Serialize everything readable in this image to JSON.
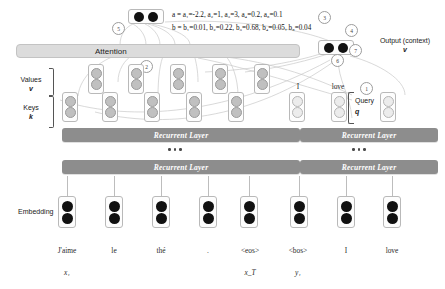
{
  "diagram": {
    "labels": {
      "attention": "Attention",
      "recurrent_layer": "Recurrent Layer",
      "embedding": "Embedding",
      "values": "Values",
      "values_symbol": "v",
      "keys": "Keys",
      "keys_symbol": "k",
      "query": "Query",
      "query_symbol": "q",
      "output": "Output (context)",
      "output_symbol": "v"
    },
    "formulas": {
      "a": "a = a₁=-2.2, a₂=1, a₃=3, a₄=0.2, a₅=0.1",
      "b": "b = b₁=0.01, b₂=0.22, b₃=0.68, b₄=0.05, b₅=0.04"
    },
    "attention_scores": {
      "a_name": "a",
      "a_values": [
        -2.2,
        1,
        3,
        0.2,
        0.1
      ],
      "b_name": "b",
      "b_values": [
        0.01,
        0.22,
        0.68,
        0.05,
        0.04
      ]
    },
    "steps": [
      {
        "id": "1",
        "meaning": "query"
      },
      {
        "id": "2",
        "meaning": "attention"
      },
      {
        "id": "3",
        "meaning": "scores-a"
      },
      {
        "id": "4",
        "meaning": "weights-b"
      },
      {
        "id": "5",
        "meaning": "weighted-sum"
      },
      {
        "id": "6",
        "meaning": "context-vector"
      },
      {
        "id": "7",
        "meaning": "output"
      }
    ],
    "encoder": {
      "tokens": [
        "J'aime",
        "le",
        "thé",
        ".",
        "<eos>"
      ],
      "subscripts": {
        "first": "x₁",
        "last": "x_T"
      },
      "layers": [
        "Recurrent Layer",
        "Recurrent Layer"
      ]
    },
    "decoder": {
      "tokens": [
        "<bos>",
        "I",
        "love"
      ],
      "state_labels": [
        "I",
        "love"
      ],
      "subscripts": {
        "first": "y₁"
      },
      "layers": [
        "Recurrent Layer",
        "Recurrent Layer"
      ]
    },
    "colors": {
      "recurrent_bar": "#8d8d8d",
      "attention_bar": "#dcdcdc",
      "embedding_dot": "#111111",
      "key_value_dot": "#c0c0c0",
      "background": "#ffffff"
    }
  }
}
